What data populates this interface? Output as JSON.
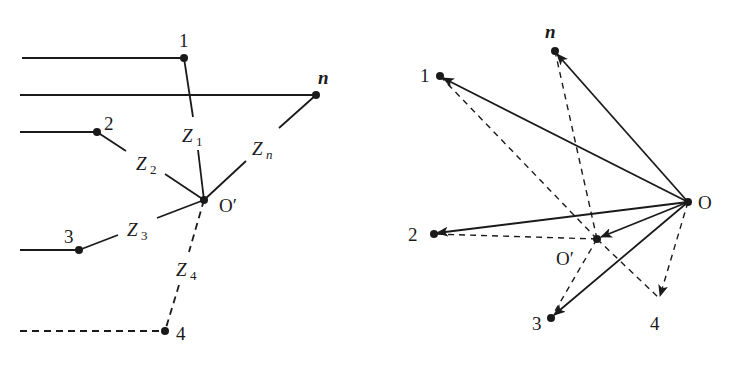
{
  "figure": {
    "left_panel": {
      "node_labels": {
        "n1": "1",
        "nn": "n",
        "n2": "2",
        "n3": "3",
        "n4": "4",
        "center": "O′"
      },
      "impedance_labels": {
        "z1": {
          "main": "Z",
          "sub": "1"
        },
        "z2": {
          "main": "Z",
          "sub": "2"
        },
        "z3": {
          "main": "Z",
          "sub": "3"
        },
        "z4": {
          "main": "Z",
          "sub": "4"
        },
        "zn": {
          "main": "Z",
          "sub": "n"
        }
      }
    },
    "right_panel": {
      "node_labels": {
        "n1": "1",
        "nn": "n",
        "n2": "2",
        "n3": "3",
        "n4": "4",
        "origin": "O",
        "shifted": "O′"
      }
    }
  }
}
